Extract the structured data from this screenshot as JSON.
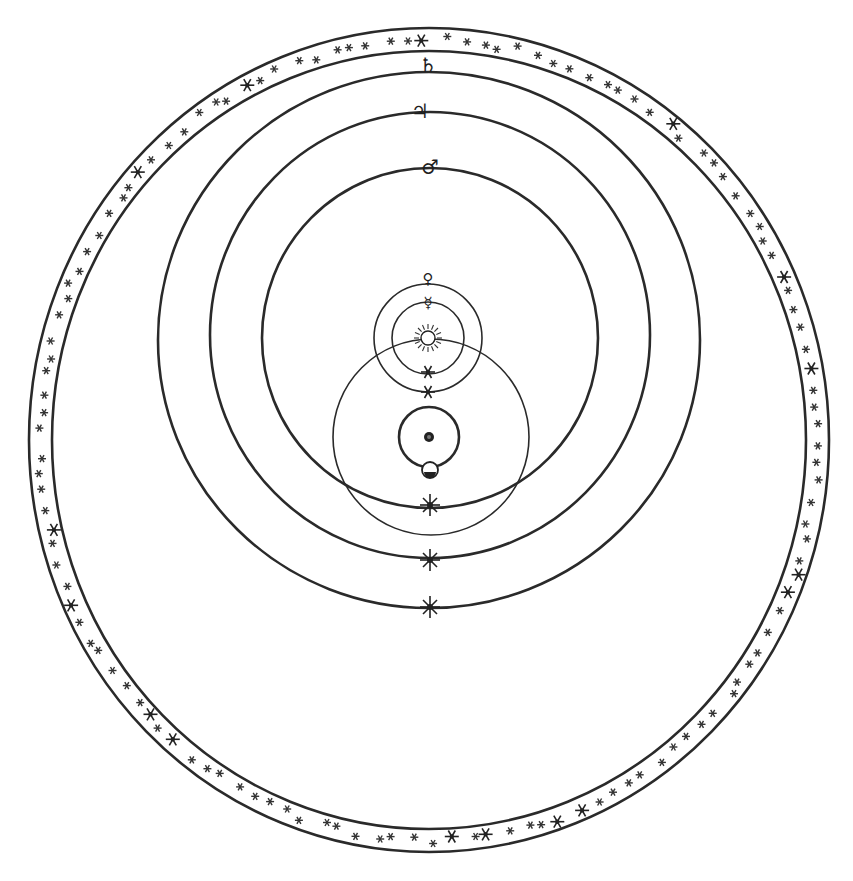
{
  "diagram": {
    "type": "Tychonic geoheliocentric system",
    "colors": {
      "ink": "#2a2a2a",
      "paper": "#ffffff"
    },
    "fixed_stars_band": {
      "label": "sphere of fixed stars",
      "center": [
        429,
        440
      ],
      "outer_r": [
        400,
        412
      ],
      "inner_r": [
        377,
        389
      ]
    },
    "orbits": [
      {
        "name": "Saturn",
        "symbol": "♄",
        "center": [
          429,
          340
        ],
        "rx": 271,
        "ry": 268
      },
      {
        "name": "Jupiter",
        "symbol": "♃",
        "center": [
          430,
          335
        ],
        "rx": 220,
        "ry": 223
      },
      {
        "name": "Mars",
        "symbol": "♂",
        "center": [
          430,
          338
        ],
        "rx": 168,
        "ry": 170
      },
      {
        "name": "Venus",
        "symbol": "♀",
        "center": [
          428,
          338
        ],
        "r": 54
      },
      {
        "name": "Mercury",
        "symbol": "☿",
        "center": [
          428,
          338
        ],
        "r": 36
      },
      {
        "name": "Sun orbit",
        "symbol": "☉",
        "center": [
          431,
          437
        ],
        "r": 98
      },
      {
        "name": "Moon orbit",
        "symbol": "☾",
        "center": [
          429,
          437
        ],
        "r": 30
      }
    ],
    "bodies": {
      "sun": {
        "symbol": "☉",
        "pos": [
          428,
          338
        ]
      },
      "earth": {
        "symbol": "●",
        "pos": [
          429,
          437
        ]
      },
      "moon": {
        "symbol": "☾",
        "pos": [
          430,
          470
        ]
      },
      "saturn": {
        "symbol": "♄",
        "pos": [
          428,
          66
        ]
      },
      "jupiter": {
        "symbol": "♃",
        "pos": [
          420,
          110
        ]
      },
      "mars": {
        "symbol": "♂",
        "pos": [
          430,
          166
        ]
      },
      "venus": {
        "symbol": "♀",
        "pos": [
          428,
          276
        ]
      },
      "mercury": {
        "symbol": "☿",
        "pos": [
          428,
          300
        ]
      }
    },
    "axis_stars": [
      {
        "pos": [
          428,
          372
        ]
      },
      {
        "pos": [
          428,
          392
        ]
      },
      {
        "pos": [
          430,
          505
        ]
      },
      {
        "pos": [
          430,
          560
        ]
      },
      {
        "pos": [
          430,
          607
        ]
      }
    ]
  }
}
